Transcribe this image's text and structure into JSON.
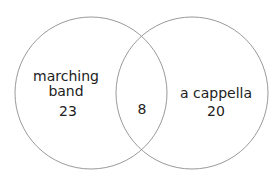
{
  "venn": {
    "left": {
      "label_line1": "marching",
      "label_line2": "band",
      "count": "23"
    },
    "overlap": {
      "count": "8"
    },
    "right": {
      "label": "a cappella",
      "count": "20"
    },
    "stroke_color": "#9a9a9a"
  }
}
